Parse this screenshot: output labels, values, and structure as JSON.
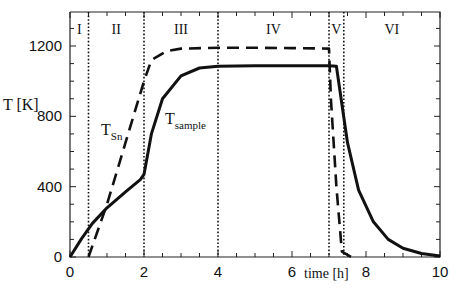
{
  "chart_data": {
    "type": "line",
    "title": "",
    "xlabel": "time [h]",
    "ylabel": "T [K]",
    "xlim": [
      0,
      10
    ],
    "ylim": [
      0,
      1400
    ],
    "x_ticks": [
      "0",
      "2",
      "4",
      "6",
      "8",
      "10"
    ],
    "y_ticks": [
      "0",
      "400",
      "800",
      "1200"
    ],
    "grid": false,
    "phases": [
      {
        "label": "I",
        "start": 0,
        "end": 0.5
      },
      {
        "label": "II",
        "start": 0.5,
        "end": 2
      },
      {
        "label": "III",
        "start": 2,
        "end": 4
      },
      {
        "label": "IV",
        "start": 4,
        "end": 7
      },
      {
        "label": "V",
        "start": 7,
        "end": 7.4
      },
      {
        "label": "VI",
        "start": 7.4,
        "end": 10
      }
    ],
    "phase_boundaries": [
      0.5,
      2,
      4,
      7,
      7.4
    ],
    "series": [
      {
        "name": "T_Sn",
        "style": "dashed",
        "label_main": "T",
        "label_sub": "Sn",
        "x": [
          0.5,
          1.0,
          1.5,
          2.0,
          2.2,
          2.6,
          3.0,
          4.0,
          5.0,
          6.0,
          7.0,
          7.05,
          7.2,
          7.35,
          7.6
        ],
        "y": [
          0,
          300,
          650,
          1000,
          1120,
          1170,
          1185,
          1190,
          1190,
          1188,
          1185,
          900,
          400,
          30,
          0
        ]
      },
      {
        "name": "T_sample",
        "style": "solid",
        "label_main": "T",
        "label_sub": "sample",
        "x": [
          0,
          0.3,
          0.6,
          1.0,
          1.5,
          1.9,
          2.0,
          2.2,
          2.5,
          3.0,
          3.5,
          4.0,
          5.0,
          6.0,
          7.0,
          7.2,
          7.5,
          7.8,
          8.2,
          8.6,
          9.0,
          9.5,
          10.0
        ],
        "y": [
          0,
          100,
          190,
          280,
          370,
          440,
          470,
          700,
          900,
          1030,
          1075,
          1085,
          1088,
          1088,
          1088,
          1085,
          650,
          380,
          200,
          100,
          50,
          20,
          5
        ]
      }
    ]
  }
}
